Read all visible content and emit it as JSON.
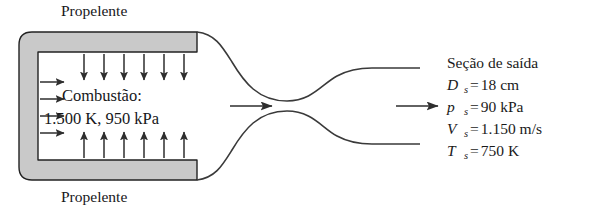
{
  "figure": {
    "type": "rocket-nozzle-schematic",
    "labels": {
      "propellant_top": "Propelente",
      "propellant_bottom": "Propelente",
      "combustion_title": "Combustão:",
      "combustion_values": "1.500 K, 950 kPa"
    },
    "exit_section": {
      "heading": "Seção de saída",
      "rows": [
        {
          "symbol": "D",
          "subscript": "s",
          "equals": "=",
          "value": "18 cm"
        },
        {
          "symbol": "p",
          "subscript": "s",
          "equals": "=",
          "value": "90 kPa"
        },
        {
          "symbol": "V",
          "subscript": "s",
          "equals": "=",
          "value": "1.150 m/s"
        },
        {
          "symbol": "T",
          "subscript": "s",
          "equals": "=",
          "value": "750 K"
        }
      ]
    },
    "arrows": {
      "top_injection_count": 6,
      "bottom_injection_count": 6,
      "left_injection_count": 4,
      "throat_flow_arrows": 2
    },
    "colors": {
      "wall_fill": "#c9c9c9",
      "wall_stroke": "#222222",
      "line": "#3a3a3a",
      "text": "#17171a",
      "background": "#ffffff"
    }
  }
}
